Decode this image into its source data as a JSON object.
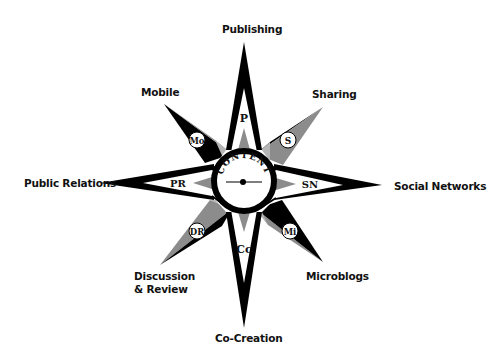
{
  "center": {
    "label": "CONTENT"
  },
  "directions": {
    "n": {
      "label": "Publishing",
      "abbr": "P"
    },
    "ne": {
      "label": "Sharing",
      "abbr": "S"
    },
    "e": {
      "label": "Social Networks",
      "abbr": "SN"
    },
    "se": {
      "label": "Microblogs",
      "abbr": "Mi"
    },
    "s": {
      "label": "Co-Creation",
      "abbr": "Cc"
    },
    "sw": {
      "label_line1": "Discussion",
      "label_line2": "& Review",
      "abbr": "DR"
    },
    "w": {
      "label": "Public Relations",
      "abbr": "PR"
    },
    "nw": {
      "label": "Mobile",
      "abbr": "Mo"
    }
  },
  "colors": {
    "dark": "#000000",
    "mid": "#8c8c8c",
    "light": "#b5b5b5",
    "bg": "#ffffff"
  }
}
